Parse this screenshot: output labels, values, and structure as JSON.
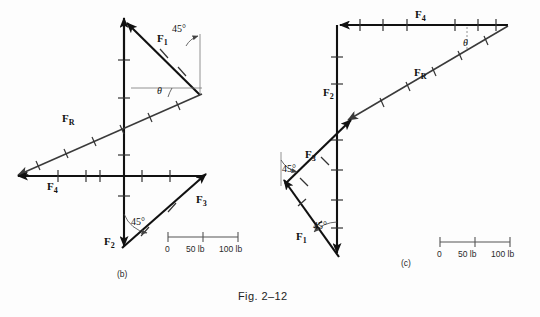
{
  "figure": {
    "caption": "Fig. 2–12",
    "background_color": "#fdfdfd",
    "ink_color": "#111111"
  },
  "panels": [
    {
      "id": "b",
      "label": "(b)",
      "description": "Force polygon with F1 up-left, F2 down, F3 up-right, F4 left and resultant FR",
      "vectors": [
        {
          "name": "F1",
          "base": "F",
          "sub": "1",
          "label_x": 160,
          "label_y": 40
        },
        {
          "name": "F2",
          "base": "F",
          "sub": "2",
          "label_x": 108,
          "label_y": 243
        },
        {
          "name": "F3",
          "base": "F",
          "sub": "3",
          "label_x": 196,
          "label_y": 203
        },
        {
          "name": "F4",
          "base": "F",
          "sub": "4",
          "label_x": 47,
          "label_y": 190
        },
        {
          "name": "FR",
          "base": "F",
          "sub": "R",
          "label_x": 62,
          "label_y": 122
        }
      ],
      "angles": [
        {
          "name": "angle-45",
          "text": "45°",
          "x": 172,
          "y": 32
        },
        {
          "name": "angle-theta",
          "text": "θ",
          "x": 161,
          "y": 93
        },
        {
          "name": "angle-45-lower",
          "text": "45°",
          "x": 131,
          "y": 225
        }
      ],
      "scale": {
        "zero": "0",
        "mid": "50 lb",
        "max": "100 lb"
      }
    },
    {
      "id": "c",
      "label": "(c)",
      "description": "Force polygon with F4 left along top, F2 vertical, F3 and F1 at 45 degrees, resultant FR",
      "vectors": [
        {
          "name": "F4",
          "base": "F",
          "sub": "4",
          "label_x": 420,
          "label_y": 17
        },
        {
          "name": "F2",
          "base": "F",
          "sub": "2",
          "label_x": 327,
          "label_y": 94
        },
        {
          "name": "FR",
          "base": "F",
          "sub": "R",
          "label_x": 417,
          "label_y": 74
        },
        {
          "name": "F3",
          "base": "F",
          "sub": "3",
          "label_x": 309,
          "label_y": 157
        },
        {
          "name": "F1",
          "base": "F",
          "sub": "1",
          "label_x": 300,
          "label_y": 238
        }
      ],
      "angles": [
        {
          "name": "angle-theta",
          "text": "θ",
          "x": 467,
          "y": 44
        },
        {
          "name": "angle-45-upper",
          "text": "45°",
          "x": 285,
          "y": 172
        },
        {
          "name": "angle-45-lower",
          "text": "45°",
          "x": 317,
          "y": 228
        }
      ],
      "scale": {
        "zero": "0",
        "mid": "50 lb",
        "max": "100 lb"
      }
    }
  ]
}
